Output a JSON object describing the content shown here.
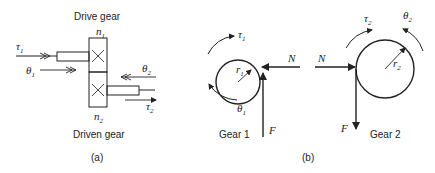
{
  "panel_a": {
    "caption": "(a)",
    "top_label": "Drive gear",
    "bottom_label": "Driven gear",
    "n1": "n",
    "n1_sub": "1",
    "n2": "n",
    "n2_sub": "2",
    "tau1": "τ",
    "tau1_sub": "1",
    "theta1": "θ",
    "theta1_sub": "1",
    "theta2": "θ",
    "theta2_sub": "2",
    "tau2": "τ",
    "tau2_sub": "2"
  },
  "panel_b": {
    "caption": "(b)",
    "gear1": {
      "label": "Gear 1",
      "tau": "τ",
      "tau_sub": "1",
      "theta": "θ",
      "theta_sub": "1",
      "r": "r",
      "r_sub": "1",
      "N": "N",
      "F": "F"
    },
    "gear2": {
      "label": "Gear 2",
      "tau": "τ",
      "tau_sub": "2",
      "theta": "θ",
      "theta_sub": "2",
      "r": "r",
      "r_sub": "2",
      "N": "N",
      "F": "F"
    }
  }
}
